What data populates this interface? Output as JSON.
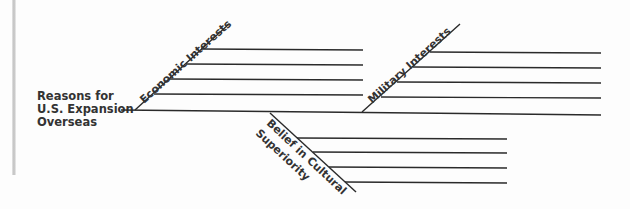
{
  "diagram": {
    "type": "fishbone",
    "root_label": [
      "Reasons for",
      "U.S. Expansion",
      "Overseas"
    ],
    "branches": [
      {
        "label": "Economic Interests",
        "lines": 4
      },
      {
        "label": "Military Interests",
        "lines": 4
      },
      {
        "label": "Belief in Cultural Superiority",
        "label_lines": [
          "Belief in Cultural",
          "Superiority"
        ],
        "lines": 4
      }
    ],
    "colors": {
      "line": "#2a2a2a",
      "text": "#333333"
    }
  }
}
